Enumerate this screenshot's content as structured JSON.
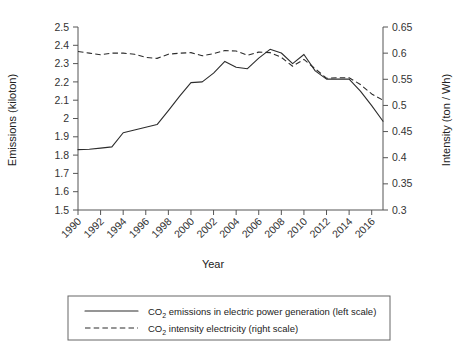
{
  "chart_data": {
    "type": "line",
    "title": "",
    "xlabel": "Year",
    "ylabel": "Emissions (kiloton)",
    "y2label": "Intensity (ton / Wh)",
    "grid": false,
    "legend_position": "bottom",
    "x": [
      1990,
      1991,
      1992,
      1993,
      1994,
      1995,
      1996,
      1997,
      1998,
      1999,
      2000,
      2001,
      2002,
      2003,
      2004,
      2005,
      2006,
      2007,
      2008,
      2009,
      2010,
      2011,
      2012,
      2013,
      2014,
      2015,
      2016,
      2017
    ],
    "xlim": [
      1990,
      2017
    ],
    "xticks": [
      "1990",
      "1992",
      "1994",
      "1996",
      "1998",
      "2000",
      "2002",
      "2004",
      "2006",
      "2008",
      "2010",
      "2012",
      "2014",
      "2016"
    ],
    "ylim": [
      1.5,
      2.5
    ],
    "yticks": [
      "2.5",
      "2.4",
      "2.3",
      "2.2",
      "2.1",
      "2",
      "1.9",
      "1.8",
      "1.7",
      "1.6",
      "1.5"
    ],
    "y2lim": [
      0.3,
      0.65
    ],
    "y2ticks": [
      "0.65",
      "0.6",
      "0.55",
      "0.5",
      "0.45",
      "0.4",
      "0.35",
      "0.3"
    ],
    "series": [
      {
        "name": "CO2 emissions in electric power generation (left scale)",
        "axis": "left",
        "style": "solid",
        "values": [
          1.83,
          1.832,
          1.838,
          1.845,
          1.922,
          1.937,
          1.952,
          1.967,
          2.043,
          2.122,
          2.196,
          2.2,
          2.248,
          2.312,
          2.28,
          2.272,
          2.33,
          2.378,
          2.358,
          2.3,
          2.35,
          2.26,
          2.215,
          2.215,
          2.215,
          2.15,
          2.07,
          1.985
        ]
      },
      {
        "name": "CO2 intensity electricity (right scale)",
        "axis": "right",
        "style": "dashed",
        "values": [
          0.603,
          0.6,
          0.597,
          0.6,
          0.6,
          0.598,
          0.592,
          0.59,
          0.598,
          0.6,
          0.601,
          0.595,
          0.599,
          0.605,
          0.604,
          0.596,
          0.602,
          0.601,
          0.592,
          0.575,
          0.588,
          0.57,
          0.552,
          0.553,
          0.553,
          0.54,
          0.522,
          0.51
        ]
      }
    ]
  },
  "legend": {
    "items": [
      {
        "prefix": "CO",
        "sub": "2",
        "text": " emissions in electric power generation (left scale)",
        "style": "solid"
      },
      {
        "prefix": "CO",
        "sub": "2",
        "text": " intensity electricity (right scale)",
        "style": "dashed"
      }
    ]
  },
  "axes": {
    "left_title": "Emissions (kiloton)",
    "right_title": "Intensity (ton / Wh)",
    "bottom_title": "Year"
  }
}
